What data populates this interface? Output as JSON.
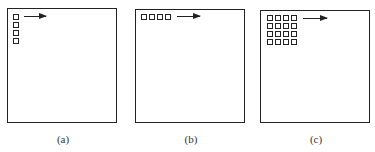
{
  "figure": {
    "panels": [
      {
        "label": "(a)",
        "layout": "vertical column",
        "rows": 4,
        "cols": 1,
        "arrow_direction": "right"
      },
      {
        "label": "(b)",
        "layout": "horizontal row",
        "rows": 1,
        "cols": 4,
        "arrow_direction": "right"
      },
      {
        "label": "(c)",
        "layout": "grid",
        "rows": 4,
        "cols": 4,
        "arrow_direction": "right"
      }
    ],
    "colors": {
      "stroke": "#222222",
      "background": "#ffffff"
    }
  }
}
